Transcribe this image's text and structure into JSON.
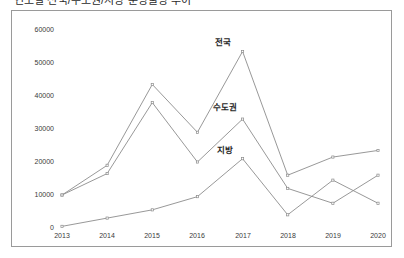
{
  "chart_data": {
    "type": "line",
    "title": "연도별 전국/수도권/지방 분양물량 추이",
    "xlabel": "",
    "ylabel": "",
    "categories": [
      "2013",
      "2014",
      "2015",
      "2016",
      "2017",
      "2018",
      "2019",
      "2020"
    ],
    "ylim": [
      0,
      60000
    ],
    "ytick_values": [
      0,
      10000,
      20000,
      30000,
      40000,
      50000,
      60000
    ],
    "ytick_labels": [
      "0",
      "10000",
      "20000",
      "30000",
      "40000",
      "50000",
      "60000"
    ],
    "grid": false,
    "legend": "inline-labels",
    "series": [
      {
        "name": "전국",
        "values": [
          10000,
          19000,
          43500,
          29000,
          53500,
          16000,
          21500,
          23500
        ],
        "color": "#8c8c8c"
      },
      {
        "name": "수도권",
        "values": [
          10000,
          16500,
          38000,
          20000,
          33000,
          12000,
          7500,
          16000
        ],
        "color": "#8c8c8c"
      },
      {
        "name": "지방",
        "values": [
          500,
          3000,
          5500,
          9500,
          21000,
          4000,
          14500,
          7500
        ],
        "color": "#8c8c8c"
      }
    ],
    "annotations": [
      {
        "text": "전국",
        "x": 2017,
        "y": 56500
      },
      {
        "text": "수도권",
        "x": 2017,
        "y": 36500
      },
      {
        "text": "지방",
        "x": 2017,
        "y": 24500
      }
    ]
  },
  "axes": {
    "y_labels": [
      "60000",
      "50000",
      "40000",
      "30000",
      "20000",
      "10000",
      "0"
    ],
    "x_labels": [
      "2013",
      "2014",
      "2015",
      "2016",
      "2017",
      "2018",
      "2019",
      "2020"
    ]
  },
  "labels": {
    "nationwide": "전국",
    "capital_area": "수도권",
    "provinces": "지방"
  }
}
